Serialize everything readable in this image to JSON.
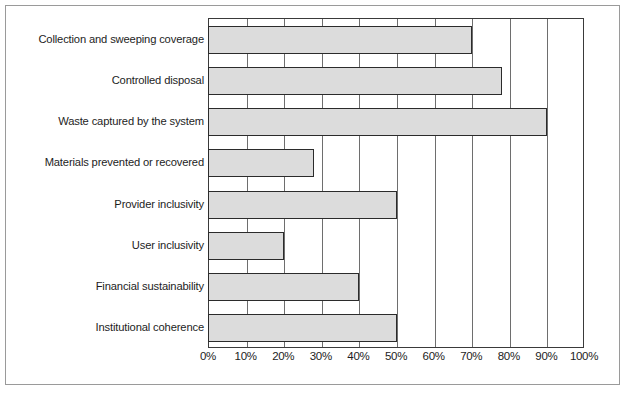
{
  "chart_data": {
    "type": "bar",
    "orientation": "horizontal",
    "title": "",
    "subtitle": "",
    "xlabel": "",
    "ylabel": "",
    "xlim": [
      0,
      100
    ],
    "xunit": "%",
    "grid": true,
    "legend": null,
    "legend_position": "none",
    "bar_fill_color": "#dcdcdc",
    "bar_edge_color": "#2b2b2b",
    "plot_border_color": "#3a3a3a",
    "categories": [
      "Collection and sweeping coverage",
      "Controlled disposal",
      "Waste captured by the system",
      "Materials prevented or recovered",
      "Provider inclusivity",
      "User inclusivity",
      "Financial sustainability",
      "Institutional coherence"
    ],
    "values": [
      70,
      78,
      90,
      28,
      50,
      20,
      40,
      50
    ],
    "xticks": [
      0,
      10,
      20,
      30,
      40,
      50,
      60,
      70,
      80,
      90,
      100
    ],
    "xticklabels": [
      "0%",
      "10%",
      "20%",
      "30%",
      "40%",
      "50%",
      "60%",
      "70%",
      "80%",
      "90%",
      "100%"
    ]
  }
}
